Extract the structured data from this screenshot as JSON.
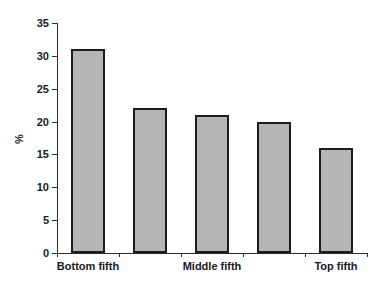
{
  "chart_data": {
    "type": "bar",
    "title": "",
    "xlabel": "",
    "ylabel": "%",
    "categories": [
      "Bottom fifth",
      "",
      "Middle fifth",
      "",
      "Top fifth"
    ],
    "values": [
      31,
      22,
      21,
      20,
      16
    ],
    "ylim": [
      0,
      35
    ],
    "yticks": [
      0,
      5,
      10,
      15,
      20,
      25,
      30,
      35
    ],
    "ytick_labels": [
      "0",
      "5",
      "10",
      "15",
      "20",
      "25",
      "30",
      "35"
    ],
    "grid": false,
    "legend": false,
    "bar_fill_color": "#b5b5b5",
    "bar_edge_color": "#1c1c1c",
    "axis_color": "#2b2b2b"
  }
}
